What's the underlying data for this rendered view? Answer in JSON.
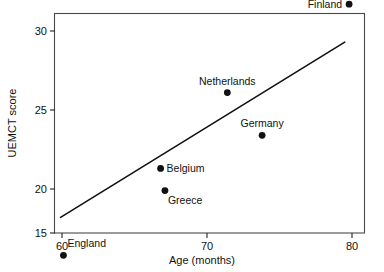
{
  "chart_data": {
    "type": "scatter",
    "title": "",
    "xlabel": "Age (months)",
    "ylabel": "UEMCT score",
    "xlim": [
      59.1,
      80.9
    ],
    "ylim": [
      15.0,
      32.5
    ],
    "xticks": [
      60,
      70,
      80
    ],
    "xtick_labels": [
      "60",
      "70",
      "80"
    ],
    "yticks": [
      15,
      20,
      25,
      30
    ],
    "ytick_labels": [
      "15",
      "20",
      "25",
      "30"
    ],
    "grid": false,
    "legend": "none",
    "points": [
      {
        "label": "England",
        "x": 60.1,
        "y": 15.8,
        "label_pos": "above-left"
      },
      {
        "label": "Belgium",
        "x": 66.8,
        "y": 21.3,
        "label_pos": "right"
      },
      {
        "label": "Greece",
        "x": 67.1,
        "y": 19.9,
        "label_pos": "below-right"
      },
      {
        "label": "Netherlands",
        "x": 71.4,
        "y": 26.1,
        "label_pos": "above"
      },
      {
        "label": "Germany",
        "x": 73.8,
        "y": 23.4,
        "label_pos": "above"
      },
      {
        "label": "Finland",
        "x": 79.8,
        "y": 31.7,
        "label_pos": "left"
      }
    ],
    "series": [
      {
        "name": "Countries",
        "x": [
          60.1,
          66.8,
          67.1,
          71.4,
          73.8,
          79.8
        ],
        "values": [
          15.8,
          21.3,
          19.9,
          26.1,
          23.4,
          31.7
        ]
      }
    ],
    "trendline": {
      "type": "linear-fit",
      "x_start": 59.9,
      "y_start": 18.2,
      "x_end": 79.5,
      "y_end": 29.3
    },
    "colors": {
      "marker": "#111111",
      "line": "#111111",
      "axis": "#4a4a4a",
      "background": "#ffffff"
    }
  }
}
